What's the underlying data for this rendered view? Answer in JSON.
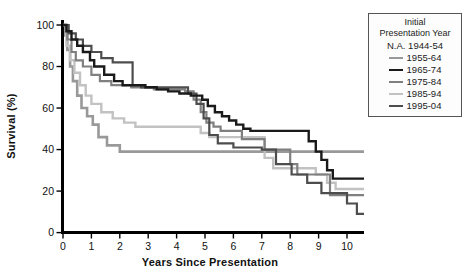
{
  "axes": {
    "y_label": "Survival (%)",
    "x_label": "Years Since Presentation",
    "y_ticks": [
      0,
      20,
      40,
      60,
      80,
      100
    ],
    "x_ticks": [
      0,
      1,
      2,
      3,
      4,
      5,
      6,
      7,
      8,
      9,
      10
    ]
  },
  "legend": {
    "title_line1": "Initial",
    "title_line2": "Presentation Year",
    "entries": [
      {
        "label": "N.A. 1944-54",
        "color": null
      },
      {
        "label": "1955-64",
        "color": "#999999"
      },
      {
        "label": "1965-74",
        "color": "#1a1a1a"
      },
      {
        "label": "1975-84",
        "color": "#808080"
      },
      {
        "label": "1985-94",
        "color": "#c2c2c2"
      },
      {
        "label": "1995-04",
        "color": "#4d4d4d"
      }
    ]
  },
  "chart_data": {
    "type": "line",
    "subtype": "kaplan-meier-step",
    "title": "",
    "xlabel": "Years Since Presentation",
    "ylabel": "Survival (%)",
    "xlim": [
      0,
      10.6
    ],
    "ylim": [
      0,
      100
    ],
    "grid": false,
    "legend_position": "top-right",
    "step": "after",
    "series": [
      {
        "name": "1955-64",
        "color": "#999999",
        "width": 2.6,
        "points": [
          [
            0,
            100
          ],
          [
            0.08,
            95
          ],
          [
            0.15,
            88
          ],
          [
            0.25,
            80
          ],
          [
            0.35,
            73
          ],
          [
            0.5,
            66
          ],
          [
            0.65,
            60
          ],
          [
            0.85,
            56
          ],
          [
            1.05,
            52
          ],
          [
            1.25,
            46
          ],
          [
            1.55,
            42
          ],
          [
            2.0,
            39
          ],
          [
            10.6,
            39
          ]
        ]
      },
      {
        "name": "1965-74",
        "color": "#1a1a1a",
        "width": 2.4,
        "points": [
          [
            0,
            100
          ],
          [
            0.12,
            97
          ],
          [
            0.3,
            93
          ],
          [
            0.5,
            90
          ],
          [
            0.7,
            87
          ],
          [
            0.95,
            83
          ],
          [
            1.1,
            80
          ],
          [
            1.45,
            76
          ],
          [
            1.8,
            73
          ],
          [
            2.1,
            71
          ],
          [
            2.9,
            70
          ],
          [
            3.3,
            69
          ],
          [
            3.7,
            68
          ],
          [
            4.1,
            67
          ],
          [
            4.5,
            66
          ],
          [
            4.9,
            64
          ],
          [
            5.1,
            61
          ],
          [
            5.35,
            58
          ],
          [
            5.6,
            56
          ],
          [
            5.85,
            54
          ],
          [
            6.1,
            52
          ],
          [
            6.35,
            50
          ],
          [
            6.6,
            49
          ],
          [
            8.4,
            49
          ],
          [
            8.65,
            44
          ],
          [
            8.9,
            39
          ],
          [
            9.1,
            35
          ],
          [
            9.3,
            30
          ],
          [
            9.5,
            26
          ],
          [
            10.6,
            26
          ]
        ]
      },
      {
        "name": "1975-84",
        "color": "#808080",
        "width": 2.2,
        "points": [
          [
            0,
            100
          ],
          [
            0.15,
            93
          ],
          [
            0.3,
            87
          ],
          [
            0.45,
            83
          ],
          [
            0.7,
            80
          ],
          [
            1.0,
            76
          ],
          [
            1.3,
            73
          ],
          [
            1.7,
            71
          ],
          [
            2.4,
            70
          ],
          [
            3.2,
            69
          ],
          [
            4.3,
            68
          ],
          [
            4.6,
            64
          ],
          [
            4.85,
            58
          ],
          [
            5.05,
            53
          ],
          [
            5.3,
            51
          ],
          [
            5.55,
            49
          ],
          [
            6.3,
            45
          ],
          [
            7.1,
            40
          ],
          [
            8.0,
            33
          ],
          [
            8.25,
            28
          ],
          [
            9.4,
            18
          ],
          [
            10.6,
            18
          ]
        ]
      },
      {
        "name": "1985-94",
        "color": "#c2c2c2",
        "width": 2.4,
        "points": [
          [
            0,
            100
          ],
          [
            0.12,
            90
          ],
          [
            0.25,
            83
          ],
          [
            0.4,
            77
          ],
          [
            0.6,
            71
          ],
          [
            0.8,
            66
          ],
          [
            1.0,
            62
          ],
          [
            1.35,
            58
          ],
          [
            1.75,
            55
          ],
          [
            2.15,
            53
          ],
          [
            2.55,
            51
          ],
          [
            4.85,
            48
          ],
          [
            5.15,
            46
          ],
          [
            7.1,
            36
          ],
          [
            7.4,
            31
          ],
          [
            8.9,
            28
          ],
          [
            9.3,
            24
          ],
          [
            9.6,
            21
          ],
          [
            10.6,
            21
          ]
        ]
      },
      {
        "name": "1995-04",
        "color": "#4d4d4d",
        "width": 2.2,
        "points": [
          [
            0,
            100
          ],
          [
            0.2,
            96
          ],
          [
            0.45,
            93
          ],
          [
            0.7,
            90
          ],
          [
            1.0,
            87
          ],
          [
            1.35,
            84
          ],
          [
            1.75,
            82
          ],
          [
            2.45,
            71
          ],
          [
            2.75,
            70
          ],
          [
            4.4,
            67
          ],
          [
            4.7,
            62
          ],
          [
            4.95,
            55
          ],
          [
            5.15,
            47
          ],
          [
            5.45,
            43
          ],
          [
            6.0,
            41
          ],
          [
            7.0,
            40
          ],
          [
            7.5,
            33
          ],
          [
            8.05,
            28
          ],
          [
            8.6,
            24
          ],
          [
            9.1,
            19
          ],
          [
            10.0,
            14
          ],
          [
            10.35,
            9
          ],
          [
            10.6,
            9
          ]
        ]
      }
    ]
  }
}
